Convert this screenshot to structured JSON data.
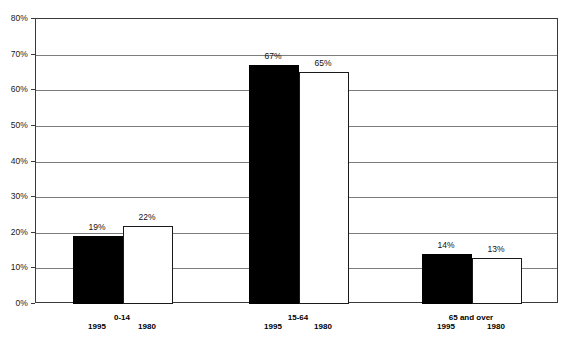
{
  "chart_data": {
    "type": "bar",
    "title": "",
    "subtitle": "",
    "xlabel": "",
    "ylabel": "",
    "categories": [
      "0-14",
      "15-64",
      "65 and over"
    ],
    "series": [
      {
        "name": "1995",
        "values": [
          19,
          67,
          14
        ],
        "color": "#000000",
        "style": "filled"
      },
      {
        "name": "1980",
        "values": [
          22,
          65,
          13
        ],
        "color": "#ffffff",
        "style": "outlined"
      }
    ],
    "value_labels": [
      [
        "19%",
        "22%"
      ],
      [
        "67%",
        "65%"
      ],
      [
        "14%",
        "13%"
      ]
    ],
    "ylim": [
      0,
      80
    ],
    "ytick_step": 10,
    "ytick_labels": [
      "0%",
      "10%",
      "20%",
      "30%",
      "40%",
      "50%",
      "60%",
      "70%",
      "80%"
    ],
    "ytick_values": [
      0,
      10,
      20,
      30,
      40,
      50,
      60,
      70,
      80
    ],
    "grid": true,
    "grid_axis": "y",
    "legend": "none",
    "legend_position": "none",
    "unit": "percent",
    "axis_color": "#3a3a3a",
    "grid_color": "#7d7d7d",
    "background": "#ffffff"
  },
  "layout": {
    "group_positions_px": [
      122,
      298,
      471
    ],
    "bar_width_px": 50,
    "group_first_bar_left_px": [
      72,
      248,
      421
    ]
  }
}
